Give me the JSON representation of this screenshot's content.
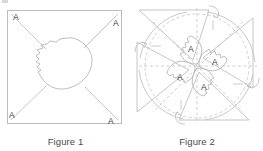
{
  "page": {
    "background_color": "#ffffff",
    "width": 263,
    "height": 151
  },
  "style": {
    "line_color": "#b8b8b8",
    "dash_color": "#c4c4c4",
    "blob_color": "#bdbdbd",
    "label_color": "#3d3d3d",
    "caption_color": "#4a4a4a"
  },
  "figure1": {
    "caption": "Figure 1",
    "shape": "square",
    "corner_labels": [
      {
        "text": "A",
        "corner": "top-left"
      },
      {
        "text": "A",
        "corner": "top-right"
      },
      {
        "text": "A",
        "corner": "bottom-left"
      },
      {
        "text": "A",
        "corner": "bottom-right"
      }
    ],
    "interior_shape": "irregular-blob",
    "diagonals": 4
  },
  "figure2": {
    "caption": "Figure 2",
    "shape": "pinwheel",
    "center_labels": [
      {
        "text": "A",
        "position": "upper-left-of-center"
      },
      {
        "text": "A",
        "position": "right-of-center"
      },
      {
        "text": "A",
        "position": "lower-left-of-center"
      },
      {
        "text": "A",
        "position": "below-center"
      }
    ],
    "arrow_count": 4,
    "dashed_guides": true
  }
}
